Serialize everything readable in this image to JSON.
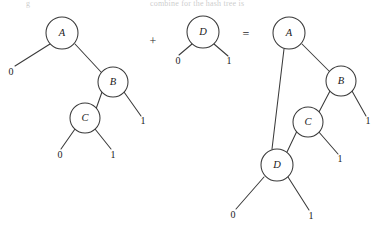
{
  "figure": {
    "caption_fragment_left": "g",
    "caption_fragment_right": "combine for the hash tree is",
    "operators": {
      "plus": "+",
      "equals": "="
    },
    "labels": {
      "zero": "0",
      "one": "1",
      "A": "A",
      "B": "B",
      "C": "C",
      "D": "D"
    },
    "colors": {
      "stroke": "#3a3a3a",
      "text": "#1a1a1a",
      "background": "#ffffff"
    }
  },
  "trees": {
    "left": {
      "name": "left-tree",
      "nodes": [
        {
          "id": "A",
          "label": "A",
          "cx": 62,
          "cy": 33,
          "r": 16
        },
        {
          "id": "B",
          "label": "B",
          "cx": 113,
          "cy": 82,
          "r": 15
        },
        {
          "id": "C",
          "label": "C",
          "cx": 85,
          "cy": 118,
          "r": 15
        }
      ],
      "leaves": [
        {
          "id": "A0",
          "label": "0",
          "x": 11,
          "y": 73
        },
        {
          "id": "B1",
          "label": "1",
          "x": 143,
          "y": 122
        },
        {
          "id": "C0",
          "label": "0",
          "x": 60,
          "y": 156
        },
        {
          "id": "C1",
          "label": "1",
          "x": 113,
          "y": 156
        }
      ],
      "edges": [
        {
          "from": "A",
          "to": "A0",
          "x1": 50,
          "y1": 44,
          "x2": 15,
          "y2": 66
        },
        {
          "from": "A",
          "to": "B",
          "x1": 75,
          "y1": 44,
          "x2": 101,
          "y2": 72
        },
        {
          "from": "B",
          "to": "C",
          "x1": 102,
          "y1": 92,
          "x2": 96,
          "y2": 109
        },
        {
          "from": "B",
          "to": "B1",
          "x1": 124,
          "y1": 92,
          "x2": 141,
          "y2": 116
        },
        {
          "from": "C",
          "to": "C0",
          "x1": 75,
          "y1": 129,
          "x2": 61,
          "y2": 149
        },
        {
          "from": "C",
          "to": "C1",
          "x1": 95,
          "y1": 129,
          "x2": 111,
          "y2": 149
        }
      ]
    },
    "middle": {
      "name": "middle-tree",
      "nodes": [
        {
          "id": "D",
          "label": "D",
          "cx": 203,
          "cy": 32,
          "r": 16
        }
      ],
      "leaves": [
        {
          "id": "D0",
          "label": "0",
          "x": 178,
          "y": 62
        },
        {
          "id": "D1",
          "label": "1",
          "x": 229,
          "y": 62
        }
      ],
      "edges": [
        {
          "from": "D",
          "to": "D0",
          "x1": 192,
          "y1": 44,
          "x2": 179,
          "y2": 55
        },
        {
          "from": "D",
          "to": "D1",
          "x1": 214,
          "y1": 44,
          "x2": 228,
          "y2": 56
        }
      ]
    },
    "right": {
      "name": "result-tree",
      "nodes": [
        {
          "id": "A",
          "label": "A",
          "cx": 289,
          "cy": 33,
          "r": 16
        },
        {
          "id": "B",
          "label": "B",
          "cx": 341,
          "cy": 81,
          "r": 15
        },
        {
          "id": "C",
          "label": "C",
          "cx": 308,
          "cy": 122,
          "r": 15
        },
        {
          "id": "D",
          "label": "D",
          "cx": 277,
          "cy": 165,
          "r": 16
        }
      ],
      "leaves": [
        {
          "id": "B1",
          "label": "1",
          "x": 368,
          "y": 122
        },
        {
          "id": "C1",
          "label": "1",
          "x": 340,
          "y": 160
        },
        {
          "id": "D0",
          "label": "0",
          "x": 233,
          "y": 216
        },
        {
          "id": "D1",
          "label": "1",
          "x": 311,
          "y": 217
        }
      ],
      "edges": [
        {
          "from": "A",
          "to": "D",
          "x1": 284,
          "y1": 49,
          "x2": 272,
          "y2": 149
        },
        {
          "from": "A",
          "to": "B",
          "x1": 302,
          "y1": 44,
          "x2": 329,
          "y2": 71
        },
        {
          "from": "B",
          "to": "C",
          "x1": 330,
          "y1": 91,
          "x2": 319,
          "y2": 112
        },
        {
          "from": "B",
          "to": "B1",
          "x1": 352,
          "y1": 91,
          "x2": 366,
          "y2": 116
        },
        {
          "from": "C",
          "to": "D",
          "x1": 297,
          "y1": 131,
          "x2": 287,
          "y2": 152
        },
        {
          "from": "C",
          "to": "C1",
          "x1": 318,
          "y1": 131,
          "x2": 338,
          "y2": 154
        },
        {
          "from": "D",
          "to": "D0",
          "x1": 264,
          "y1": 177,
          "x2": 236,
          "y2": 209
        },
        {
          "from": "D",
          "to": "D1",
          "x1": 288,
          "y1": 177,
          "x2": 309,
          "y2": 210
        }
      ]
    }
  },
  "operator_positions": {
    "plus": {
      "x": 153,
      "y": 42
    },
    "equals": {
      "x": 246,
      "y": 35
    }
  }
}
